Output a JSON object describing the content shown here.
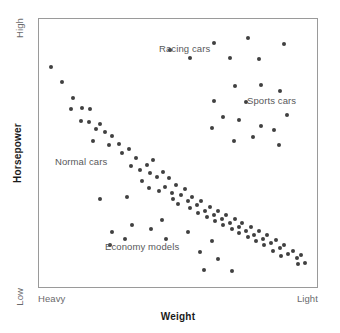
{
  "chart_data": {
    "type": "scatter",
    "title": "",
    "xlabel": "Weight",
    "ylabel": "Horsepower",
    "xlim": [
      0,
      100
    ],
    "ylim": [
      0,
      100
    ],
    "grid": false,
    "legend": "none",
    "x_tick_labels": [
      "Heavy",
      "Light"
    ],
    "y_tick_labels": [
      "Low",
      "High"
    ],
    "x_axis_note": "Weight decreases left to right: left end is Heavy, right end is Light",
    "y_axis_note": "Horsepower increases bottom to top: bottom end is Low, top end is High",
    "annotations": [
      {
        "text": "Racing cars",
        "x": 52,
        "y": 91
      },
      {
        "text": "Sports cars",
        "x": 84,
        "y": 72
      },
      {
        "text": "Normal cars",
        "x": 14,
        "y": 49
      },
      {
        "text": "Economy models",
        "x": 32,
        "y": 17
      }
    ],
    "series": [
      {
        "name": "Normal cars",
        "marker": "filled-circle",
        "color": "#404040",
        "points": [
          [
            4.3,
            82.0
          ],
          [
            8.2,
            76.5
          ],
          [
            12.1,
            70.5
          ],
          [
            11.4,
            66.5
          ],
          [
            15.4,
            66.8
          ],
          [
            18.2,
            66.5
          ],
          [
            15.0,
            62.0
          ],
          [
            17.9,
            61.5
          ],
          [
            20.4,
            59.0
          ],
          [
            22.1,
            61.0
          ],
          [
            23.6,
            58.0
          ],
          [
            19.3,
            54.5
          ],
          [
            26.1,
            56.2
          ],
          [
            25.0,
            53.0
          ],
          [
            28.9,
            53.5
          ],
          [
            30.0,
            50.0
          ],
          [
            32.5,
            51.5
          ],
          [
            35.0,
            48.0
          ],
          [
            33.2,
            45.0
          ],
          [
            36.4,
            43.5
          ],
          [
            38.9,
            45.5
          ],
          [
            41.1,
            47.5
          ],
          [
            40.0,
            42.5
          ],
          [
            42.5,
            41.0
          ],
          [
            44.6,
            43.0
          ],
          [
            46.8,
            40.5
          ],
          [
            37.1,
            39.5
          ],
          [
            39.6,
            37.0
          ],
          [
            43.2,
            36.0
          ],
          [
            45.4,
            37.5
          ],
          [
            47.9,
            35.0
          ],
          [
            49.3,
            38.0
          ],
          [
            48.2,
            33.0
          ],
          [
            51.1,
            34.5
          ],
          [
            52.5,
            36.5
          ],
          [
            50.0,
            31.0
          ],
          [
            53.6,
            32.0
          ],
          [
            55.0,
            33.5
          ],
          [
            54.3,
            29.5
          ],
          [
            56.8,
            30.5
          ],
          [
            58.2,
            32.0
          ],
          [
            57.1,
            27.5
          ],
          [
            59.6,
            28.5
          ],
          [
            61.4,
            30.0
          ],
          [
            60.4,
            26.0
          ],
          [
            62.9,
            27.0
          ],
          [
            64.3,
            28.5
          ],
          [
            63.2,
            24.5
          ],
          [
            65.7,
            25.5
          ],
          [
            67.1,
            27.0
          ],
          [
            66.1,
            23.0
          ],
          [
            68.6,
            24.0
          ],
          [
            70.4,
            25.5
          ],
          [
            69.3,
            21.5
          ],
          [
            71.8,
            22.5
          ],
          [
            73.2,
            24.0
          ],
          [
            72.1,
            20.0
          ],
          [
            74.6,
            21.0
          ],
          [
            76.1,
            22.5
          ],
          [
            75.0,
            18.5
          ],
          [
            77.5,
            19.5
          ],
          [
            79.3,
            21.0
          ],
          [
            78.2,
            17.0
          ],
          [
            80.7,
            18.0
          ],
          [
            82.1,
            19.5
          ],
          [
            81.1,
            15.5
          ],
          [
            83.6,
            16.5
          ],
          [
            85.4,
            17.5
          ],
          [
            84.3,
            13.5
          ],
          [
            86.8,
            14.5
          ],
          [
            88.2,
            15.5
          ],
          [
            87.1,
            11.5
          ],
          [
            89.6,
            12.5
          ],
          [
            91.4,
            13.5
          ],
          [
            92.9,
            11.0
          ],
          [
            94.3,
            12.0
          ],
          [
            93.2,
            8.5
          ],
          [
            95.7,
            9.0
          ]
        ]
      },
      {
        "name": "Racing cars",
        "marker": "filled-circle",
        "color": "#404040",
        "points": [
          [
            47.1,
            88.5
          ],
          [
            62.9,
            91.0
          ],
          [
            75.0,
            93.0
          ],
          [
            88.2,
            90.5
          ],
          [
            54.3,
            85.5
          ],
          [
            68.6,
            85.5
          ],
          [
            79.3,
            85.0
          ]
        ]
      },
      {
        "name": "Sports cars",
        "marker": "filled-circle",
        "color": "#404040",
        "points": [
          [
            70.4,
            75.0
          ],
          [
            80.0,
            75.5
          ],
          [
            86.8,
            73.0
          ],
          [
            62.9,
            69.5
          ],
          [
            74.3,
            69.0
          ],
          [
            66.1,
            63.5
          ],
          [
            71.8,
            62.5
          ],
          [
            89.3,
            64.0
          ],
          [
            62.1,
            59.5
          ],
          [
            80.0,
            60.0
          ],
          [
            84.6,
            58.5
          ],
          [
            77.1,
            56.0
          ],
          [
            70.0,
            54.5
          ],
          [
            86.4,
            53.0
          ]
        ]
      },
      {
        "name": "Economy models",
        "marker": "filled-circle",
        "color": "#404040",
        "points": [
          [
            22.1,
            33.0
          ],
          [
            31.8,
            33.5
          ],
          [
            33.6,
            23.0
          ],
          [
            26.4,
            20.5
          ],
          [
            31.1,
            18.0
          ],
          [
            44.3,
            25.0
          ],
          [
            40.4,
            21.5
          ],
          [
            45.7,
            18.0
          ],
          [
            25.4,
            15.5
          ],
          [
            53.6,
            20.5
          ],
          [
            57.9,
            13.0
          ],
          [
            62.1,
            17.0
          ],
          [
            64.3,
            10.5
          ],
          [
            59.3,
            6.5
          ],
          [
            69.3,
            6.0
          ]
        ]
      }
    ]
  },
  "axes": {
    "y_top_label": "High",
    "y_bottom_label": "Low",
    "x_left_label": "Heavy",
    "x_right_label": "Light",
    "y_title": "Horsepower",
    "x_title": "Weight"
  },
  "clusters": {
    "racing": "Racing cars",
    "sports": "Sports cars",
    "normal": "Normal cars",
    "economy": "Economy models"
  },
  "style": {
    "point_color": "#404040",
    "frame_color": "#9a9a9a",
    "label_color": "#58585a",
    "axis_end_color": "#6a6a6c",
    "title_color": "#1a1a1a",
    "background": "#ffffff"
  }
}
